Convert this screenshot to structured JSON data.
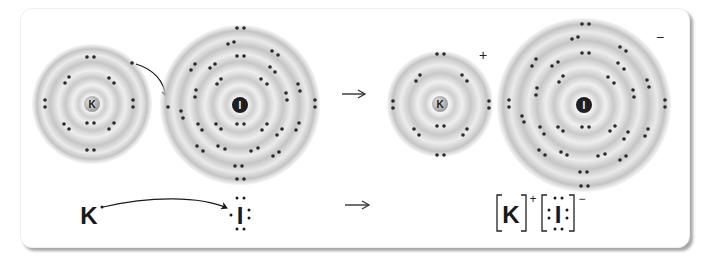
{
  "figure": {
    "arrow_symbol": "→",
    "colors": {
      "electron": "#2a2a2a",
      "shell_band": "#c8c8c8",
      "shell_gap": "#f2f2f2",
      "iodine_nucleus": "#1f1f1f",
      "potassium_nucleus": "#bdbdbd",
      "text": "#1a1a1a"
    }
  },
  "reactants": {
    "potassium_atom": {
      "nucleus_label": "K",
      "shells": 4,
      "electrons_per_shell": [
        2,
        8,
        8,
        1
      ]
    },
    "iodine_atom": {
      "nucleus_label": "I",
      "shells": 5,
      "electrons_per_shell": [
        2,
        8,
        18,
        18,
        7
      ]
    },
    "transfer_arrow": "curved-arrow"
  },
  "products": {
    "potassium_ion": {
      "nucleus_label": "K",
      "charge": "+",
      "shells": 3,
      "electrons_per_shell": [
        2,
        8,
        8
      ]
    },
    "iodide_ion": {
      "nucleus_label": "I",
      "charge": "−",
      "shells": 5,
      "electrons_per_shell": [
        2,
        8,
        18,
        18,
        8
      ]
    }
  },
  "lewis": {
    "reactant_k": "K",
    "reactant_i": "I",
    "product_k": "K",
    "product_k_charge": "+",
    "product_i": "I",
    "product_i_charge": "−",
    "bracket_left": "[",
    "bracket_right": "]"
  }
}
